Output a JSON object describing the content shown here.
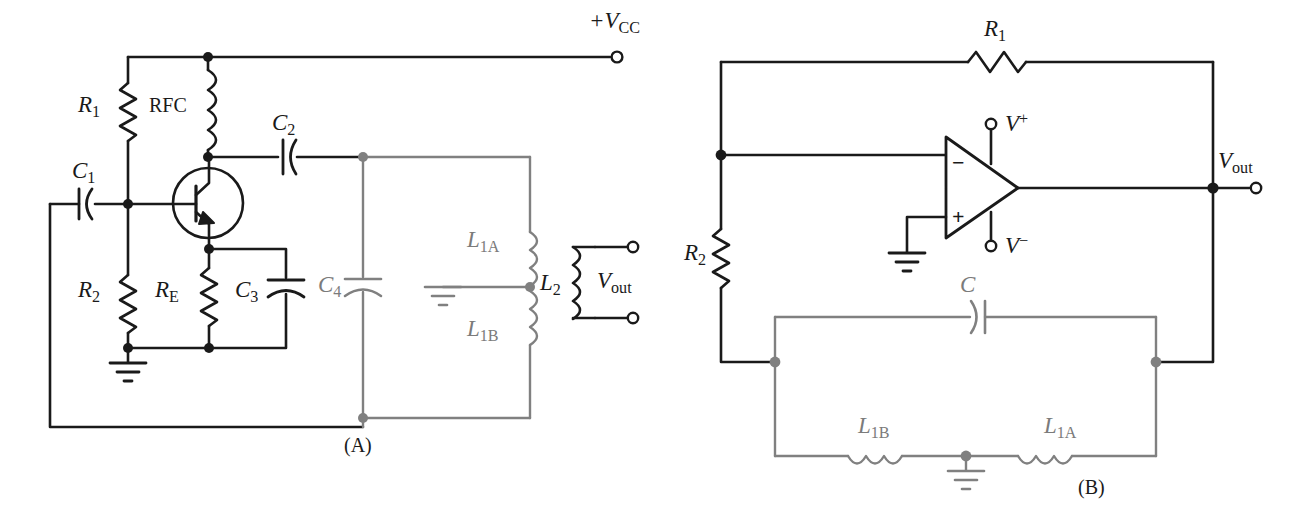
{
  "figure": {
    "panels": [
      {
        "id": "A",
        "caption": "(A)",
        "caption_x": 359,
        "caption_y": 446
      },
      {
        "id": "B",
        "caption": "(B)",
        "caption_y": 486,
        "caption_x": 1090
      }
    ],
    "colors": {
      "black": "#1a1a1a",
      "gray": "#808080",
      "background": "#ffffff"
    }
  },
  "panel_a": {
    "name": "transistor-colpitts-oscillator",
    "labels": {
      "supply": "+V",
      "supply_sub": "CC",
      "r1": "R",
      "r1_sub": "1",
      "rfc": "RFC",
      "c1": "C",
      "c1_sub": "1",
      "c2": "C",
      "c2_sub": "2",
      "r2": "R",
      "r2_sub": "2",
      "re": "R",
      "re_sub": "E",
      "c3": "C",
      "c3_sub": "3",
      "c4": "C",
      "c4_sub": "4",
      "l1a": "L",
      "l1a_sub": "1A",
      "l1b": "L",
      "l1b_sub": "1B",
      "l2": "L",
      "l2_sub": "2",
      "vout": "V",
      "vout_sub": "out"
    },
    "components": [
      {
        "name": "resistor-r1",
        "type": "resistor",
        "label": "R1",
        "color": "black"
      },
      {
        "name": "inductor-rfc",
        "type": "inductor",
        "label": "RFC",
        "color": "black"
      },
      {
        "name": "capacitor-c1",
        "type": "capacitor",
        "label": "C1",
        "color": "black"
      },
      {
        "name": "capacitor-c2",
        "type": "capacitor",
        "label": "C2",
        "color": "black"
      },
      {
        "name": "transistor-q1",
        "type": "npn-bjt",
        "label": "",
        "color": "black"
      },
      {
        "name": "resistor-r2",
        "type": "resistor",
        "label": "R2",
        "color": "black"
      },
      {
        "name": "resistor-re",
        "type": "resistor",
        "label": "RE",
        "color": "black"
      },
      {
        "name": "capacitor-c3",
        "type": "capacitor",
        "label": "C3",
        "color": "black"
      },
      {
        "name": "capacitor-c4",
        "type": "capacitor",
        "label": "C4",
        "color": "gray"
      },
      {
        "name": "inductor-l1a",
        "type": "inductor",
        "label": "L1A",
        "color": "gray"
      },
      {
        "name": "inductor-l1b",
        "type": "inductor",
        "label": "L1B",
        "color": "gray"
      },
      {
        "name": "inductor-l2",
        "type": "inductor",
        "label": "L2",
        "color": "black"
      },
      {
        "name": "ground-emitter",
        "type": "ground",
        "color": "black"
      },
      {
        "name": "ground-tank",
        "type": "ground",
        "color": "gray"
      },
      {
        "name": "terminal-vcc",
        "type": "terminal",
        "color": "black"
      },
      {
        "name": "terminal-vout-top",
        "type": "terminal",
        "color": "black"
      },
      {
        "name": "terminal-vout-bottom",
        "type": "terminal",
        "color": "black"
      }
    ]
  },
  "panel_b": {
    "name": "opamp-colpitts-oscillator",
    "labels": {
      "r1": "R",
      "r1_sub": "1",
      "r2": "R",
      "r2_sub": "2",
      "c": "C",
      "l1a": "L",
      "l1a_sub": "1A",
      "l1b": "L",
      "l1b_sub": "1B",
      "vplus": "V",
      "vplus_sup": "+",
      "vminus": "V",
      "vminus_sup": "−",
      "vout": "V",
      "vout_sub": "out",
      "opamp_minus": "−",
      "opamp_plus": "+"
    },
    "components": [
      {
        "name": "resistor-r1",
        "type": "resistor",
        "label": "R1",
        "color": "black"
      },
      {
        "name": "resistor-r2",
        "type": "resistor",
        "label": "R2",
        "color": "black"
      },
      {
        "name": "opamp",
        "type": "operational-amplifier",
        "color": "black"
      },
      {
        "name": "capacitor-c",
        "type": "capacitor",
        "label": "C",
        "color": "gray"
      },
      {
        "name": "inductor-l1a",
        "type": "inductor",
        "label": "L1A",
        "color": "gray"
      },
      {
        "name": "inductor-l1b",
        "type": "inductor",
        "label": "L1B",
        "color": "gray"
      },
      {
        "name": "ground-noninverting",
        "type": "ground",
        "color": "black"
      },
      {
        "name": "ground-tank-center",
        "type": "ground",
        "color": "gray"
      },
      {
        "name": "terminal-vplus",
        "type": "terminal",
        "color": "black"
      },
      {
        "name": "terminal-vminus",
        "type": "terminal",
        "color": "black"
      },
      {
        "name": "terminal-vout",
        "type": "terminal",
        "color": "black"
      }
    ]
  }
}
